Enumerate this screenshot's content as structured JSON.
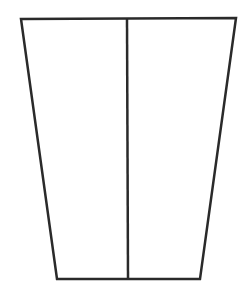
{
  "diagram": {
    "shape": "trapezoid-divided",
    "stroke_color": "#2a2a2a",
    "background": "#ffffff",
    "stroke_width": 2.5,
    "trapezoid": {
      "top_left": [
        21,
        19
      ],
      "top_right": [
        236,
        18
      ],
      "bottom_right": [
        200,
        279
      ],
      "bottom_left": [
        57,
        279
      ]
    },
    "divider": {
      "top": [
        127,
        19
      ],
      "bottom": [
        128,
        279
      ]
    }
  }
}
